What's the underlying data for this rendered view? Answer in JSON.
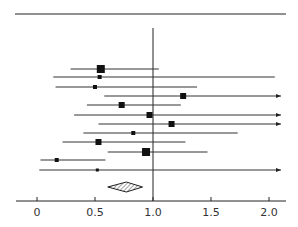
{
  "chart_data": {
    "type": "forest",
    "title": "",
    "xlabel": "",
    "ylabel": "",
    "xlim": [
      -0.1,
      2.1
    ],
    "xticks": [
      0,
      0.5,
      1.0,
      1.5,
      2.0
    ],
    "xtick_labels": [
      "0",
      "0.5",
      "1.0",
      "1.5",
      "2.0"
    ],
    "reference_line": 1.0,
    "grid": false,
    "legend": null,
    "studies": [
      {
        "estimate": 0.55,
        "lower": 0.29,
        "upper": 1.05,
        "weight": "large",
        "arrow": false
      },
      {
        "estimate": 0.54,
        "lower": 0.14,
        "upper": 2.05,
        "weight": "small",
        "arrow": false
      },
      {
        "estimate": 0.5,
        "lower": 0.16,
        "upper": 1.38,
        "weight": "small",
        "arrow": false
      },
      {
        "estimate": 1.26,
        "lower": 0.58,
        "upper": 2.1,
        "weight": "medium",
        "arrow": true
      },
      {
        "estimate": 0.73,
        "lower": 0.43,
        "upper": 1.24,
        "weight": "medium",
        "arrow": false
      },
      {
        "estimate": 0.97,
        "lower": 0.32,
        "upper": 2.1,
        "weight": "medium",
        "arrow": true
      },
      {
        "estimate": 1.16,
        "lower": 0.53,
        "upper": 2.1,
        "weight": "medium",
        "arrow": true
      },
      {
        "estimate": 0.83,
        "lower": 0.4,
        "upper": 1.73,
        "weight": "small",
        "arrow": false
      },
      {
        "estimate": 0.53,
        "lower": 0.22,
        "upper": 1.28,
        "weight": "medium",
        "arrow": false
      },
      {
        "estimate": 0.94,
        "lower": 0.61,
        "upper": 1.47,
        "weight": "large",
        "arrow": false
      },
      {
        "estimate": 0.17,
        "lower": 0.03,
        "upper": 0.59,
        "weight": "small",
        "arrow": false
      },
      {
        "estimate": 0.52,
        "lower": 0.02,
        "upper": 2.1,
        "weight": "tiny",
        "arrow": true
      }
    ],
    "pooled": {
      "estimate": 0.77,
      "lower": 0.61,
      "upper": 0.91,
      "shape": "hatched-diamond"
    }
  }
}
